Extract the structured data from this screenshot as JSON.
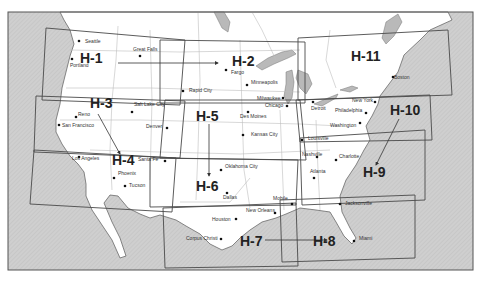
{
  "map": {
    "type": "chart-coverage-index",
    "regions": [
      {
        "id": "H-1",
        "label": "H-1",
        "x": 80,
        "y": 63
      },
      {
        "id": "H-2",
        "label": "H-2",
        "x": 232,
        "y": 66
      },
      {
        "id": "H-3",
        "label": "H-3",
        "x": 90,
        "y": 108
      },
      {
        "id": "H-4",
        "label": "H-4",
        "x": 112,
        "y": 165
      },
      {
        "id": "H-5",
        "label": "H-5",
        "x": 196,
        "y": 121
      },
      {
        "id": "H-6",
        "label": "H-6",
        "x": 196,
        "y": 191
      },
      {
        "id": "H-7",
        "label": "H-7",
        "x": 240,
        "y": 246
      },
      {
        "id": "H-8",
        "label": "H-8",
        "x": 313,
        "y": 246
      },
      {
        "id": "H-9",
        "label": "H-9",
        "x": 363,
        "y": 177
      },
      {
        "id": "H-10",
        "label": "H-10",
        "x": 390,
        "y": 115
      },
      {
        "id": "H-11",
        "label": "H-11",
        "x": 351,
        "y": 61
      }
    ],
    "cities": [
      {
        "name": "Seattle",
        "x": 79,
        "y": 41,
        "lx": 85,
        "ly": 43
      },
      {
        "name": "Portland",
        "x": 72,
        "y": 59,
        "lx": 70,
        "ly": 67
      },
      {
        "name": "Great Falls",
        "x": 140,
        "y": 56,
        "lx": 133,
        "ly": 51
      },
      {
        "name": "Fargo",
        "x": 226,
        "y": 70,
        "lx": 231,
        "ly": 74
      },
      {
        "name": "Minneapolis",
        "x": 247,
        "y": 85,
        "lx": 251,
        "ly": 84
      },
      {
        "name": "Rapid City",
        "x": 183,
        "y": 91,
        "lx": 189,
        "ly": 92
      },
      {
        "name": "Salt Lake City",
        "x": 132,
        "y": 112,
        "lx": 134,
        "ly": 106
      },
      {
        "name": "Reno",
        "x": 76,
        "y": 117,
        "lx": 78,
        "ly": 116
      },
      {
        "name": "San Francisco",
        "x": 59,
        "y": 125,
        "lx": 62,
        "ly": 127
      },
      {
        "name": "Denver",
        "x": 167,
        "y": 128,
        "lx": 146,
        "ly": 128
      },
      {
        "name": "Milwaukee",
        "x": 283,
        "y": 98,
        "lx": 257,
        "ly": 100
      },
      {
        "name": "Chicago",
        "x": 287,
        "y": 106,
        "lx": 265,
        "ly": 107
      },
      {
        "name": "Des Moines",
        "x": 248,
        "y": 112,
        "lx": 240,
        "ly": 118
      },
      {
        "name": "Kansas City",
        "x": 243,
        "y": 135,
        "lx": 251,
        "ly": 136
      },
      {
        "name": "Detroit",
        "x": 313,
        "y": 102,
        "lx": 311,
        "ly": 110
      },
      {
        "name": "New York",
        "x": 375,
        "y": 102,
        "lx": 352,
        "ly": 102
      },
      {
        "name": "Philadelphia",
        "x": 366,
        "y": 113,
        "lx": 335,
        "ly": 112
      },
      {
        "name": "Washington",
        "x": 360,
        "y": 123,
        "lx": 330,
        "ly": 127
      },
      {
        "name": "Louisville",
        "x": 302,
        "y": 140,
        "lx": 308,
        "ly": 140
      },
      {
        "name": "Boston",
        "x": 393,
        "y": 77,
        "lx": 394,
        "ly": 79
      },
      {
        "name": "Los Angeles",
        "x": 79,
        "y": 157,
        "lx": 72,
        "ly": 160
      },
      {
        "name": "Santa Fe",
        "x": 165,
        "y": 161,
        "lx": 138,
        "ly": 161
      },
      {
        "name": "Phoenix",
        "x": 114,
        "y": 178,
        "lx": 118,
        "ly": 175
      },
      {
        "name": "Tucson",
        "x": 125,
        "y": 186,
        "lx": 129,
        "ly": 187
      },
      {
        "name": "Oklahoma City",
        "x": 221,
        "y": 170,
        "lx": 225,
        "ly": 168
      },
      {
        "name": "Dallas",
        "x": 227,
        "y": 193,
        "lx": 223,
        "ly": 199
      },
      {
        "name": "Nashville",
        "x": 317,
        "y": 157,
        "lx": 302,
        "ly": 156
      },
      {
        "name": "Charlotte",
        "x": 336,
        "y": 160,
        "lx": 339,
        "ly": 158
      },
      {
        "name": "Atlanta",
        "x": 314,
        "y": 178,
        "lx": 310,
        "ly": 173
      },
      {
        "name": "Mobile",
        "x": 292,
        "y": 204,
        "lx": 273,
        "ly": 200
      },
      {
        "name": "New Orleans",
        "x": 275,
        "y": 213,
        "lx": 246,
        "ly": 212
      },
      {
        "name": "Houston",
        "x": 236,
        "y": 219,
        "lx": 212,
        "ly": 221
      },
      {
        "name": "Corpus Christi",
        "x": 221,
        "y": 239,
        "lx": 186,
        "ly": 240
      },
      {
        "name": "Jacksonville",
        "x": 340,
        "y": 204,
        "lx": 345,
        "ly": 205
      },
      {
        "name": "Miami",
        "x": 354,
        "y": 241,
        "lx": 359,
        "ly": 240
      }
    ],
    "colors": {
      "ocean": "#cfcfcf",
      "land": "#ffffff",
      "lakes": "#b9b9b9",
      "boxes": "#4a4a4a",
      "text": "#222222"
    }
  }
}
